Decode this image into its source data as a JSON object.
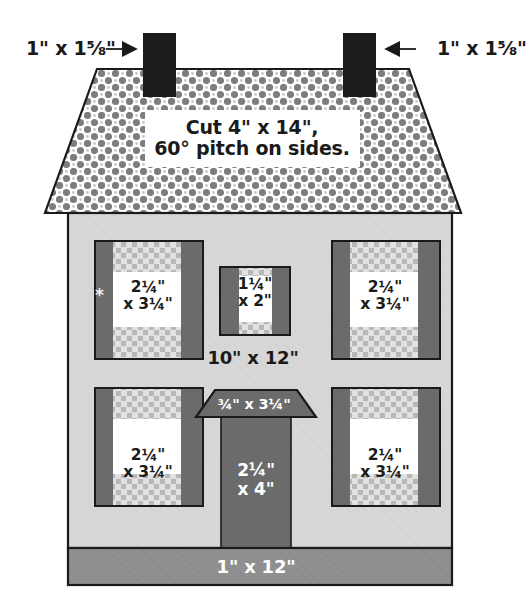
{
  "colors": {
    "outline": "#1a1a1a",
    "chimney": "#1c1c1c",
    "roof_checker_dark": "#808080",
    "roof_checker_light": "#ffffff",
    "house_body": "#d6d6d6",
    "shutter": "#6b6b6b",
    "window_pane": "#ffffff",
    "curtain_check": "#b5b5b5",
    "door": "#6b6b6b",
    "awning": "#6b6b6b",
    "foundation": "#8f8f8f",
    "label_text": "#1a1a1a",
    "label_text_white": "#ffffff"
  },
  "chimneys": {
    "left": {
      "label": "1\" x 1⅝\"",
      "arrow": "arrow-right"
    },
    "right": {
      "label": "1\" x 1⅝\"",
      "arrow": "arrow-left"
    }
  },
  "roof": {
    "note_line1": "Cut 4\" x 14\",",
    "note_line2": "60° pitch on sides."
  },
  "body": {
    "label": "10\" x 12\""
  },
  "windows": [
    {
      "id": "top-left",
      "line1": "2¼\"",
      "line2": "x 3¼\"",
      "marker": "*"
    },
    {
      "id": "top-center",
      "line1": "1¼\"",
      "line2": "x 2\"",
      "marker": ""
    },
    {
      "id": "top-right",
      "line1": "2¼\"",
      "line2": "x 3¼\"",
      "marker": ""
    },
    {
      "id": "bottom-left",
      "line1": "2¼\"",
      "line2": "x 3¼\"",
      "marker": ""
    },
    {
      "id": "bottom-right",
      "line1": "2¼\"",
      "line2": "x 3¼\"",
      "marker": ""
    }
  ],
  "door": {
    "awning_label": "¾\" x 3¼\"",
    "line1": "2¼\"",
    "line2": "x 4\""
  },
  "foundation": {
    "label": "1\" x 12\""
  }
}
